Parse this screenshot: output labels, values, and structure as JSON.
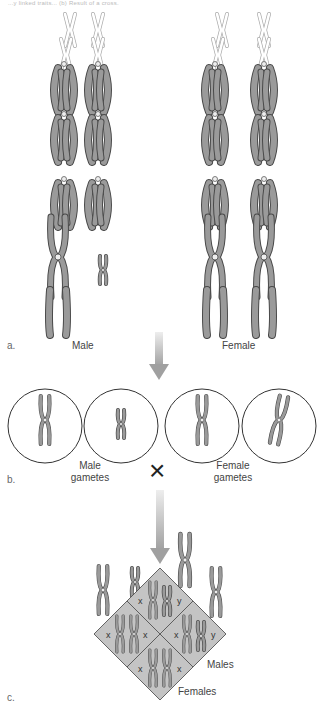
{
  "caption": "...y linked traits... (b) Result of a cross.",
  "panel_a": {
    "label": "a.",
    "male_label": "Male",
    "female_label": "Female"
  },
  "panel_b": {
    "label": "b.",
    "male_gametes_label": "Male\ngametes",
    "male_gametes_line1": "Male",
    "male_gametes_line2": "gametes",
    "female_gametes_line1": "Female",
    "female_gametes_line2": "gametes",
    "cross_symbol": "×"
  },
  "panel_c": {
    "label": "c.",
    "cells": [
      {
        "position": "top",
        "left": "x",
        "right": "y"
      },
      {
        "position": "left",
        "left": "x",
        "right": "x"
      },
      {
        "position": "right",
        "left": "x",
        "right": "y"
      },
      {
        "position": "bottom",
        "left": "x",
        "right": "x"
      }
    ],
    "males_label": "Males",
    "females_label": "Females"
  },
  "colors": {
    "chromosome_fill": "#9a9a9a",
    "chromosome_stroke": "#4a4a4a",
    "punnett_fill": "#c4c4c4",
    "arrow": "#a8a8a8"
  }
}
